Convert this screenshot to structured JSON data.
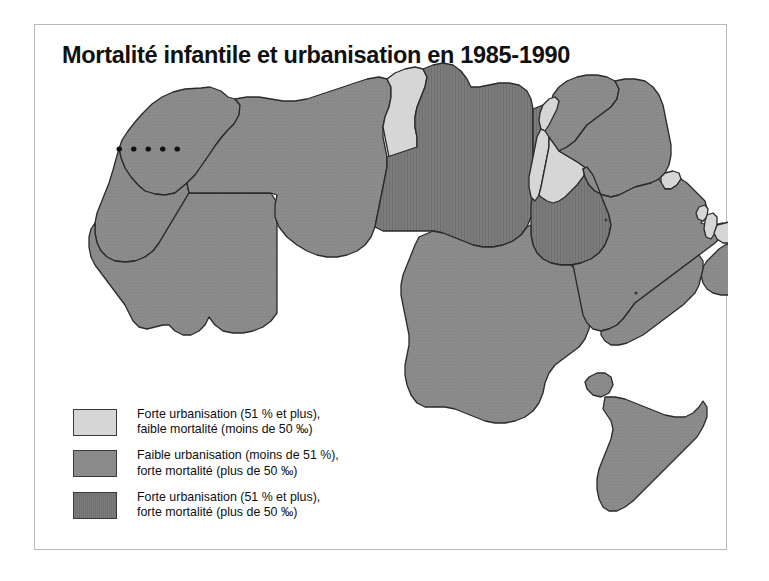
{
  "figure": {
    "title": "Mortalité infantile et urbanisation en 1985-1990",
    "background_color": "#ffffff",
    "frame_color": "#b9b9b9"
  },
  "map": {
    "region_name": "Afrique du Nord et Moyen-Orient",
    "ocean_color": "#ffffff",
    "border_color": "#2a2a2a",
    "disputed_border_style": "dotted",
    "classes": {
      "light": "#d6d6d6",
      "medium": "#8b8b8b",
      "dark": "#7c7c7c"
    },
    "countries": [
      {
        "name": "Maroc",
        "class": "medium"
      },
      {
        "name": "Sahara occidental",
        "class": "medium"
      },
      {
        "name": "Mauritanie",
        "class": "medium"
      },
      {
        "name": "Algérie",
        "class": "medium"
      },
      {
        "name": "Tunisie",
        "class": "light"
      },
      {
        "name": "Libye",
        "class": "dark"
      },
      {
        "name": "Égypte",
        "class": "dark"
      },
      {
        "name": "Soudan",
        "class": "medium"
      },
      {
        "name": "Djibouti",
        "class": "medium"
      },
      {
        "name": "Somalie",
        "class": "medium"
      },
      {
        "name": "Syrie",
        "class": "medium"
      },
      {
        "name": "Liban",
        "class": "light"
      },
      {
        "name": "Israël",
        "class": "light"
      },
      {
        "name": "Jordanie",
        "class": "light"
      },
      {
        "name": "Irak",
        "class": "medium"
      },
      {
        "name": "Koweït",
        "class": "light"
      },
      {
        "name": "Arabie saoudite",
        "class": "medium"
      },
      {
        "name": "Bahreïn",
        "class": "light"
      },
      {
        "name": "Qatar",
        "class": "light"
      },
      {
        "name": "Émirats arabes unis",
        "class": "light"
      },
      {
        "name": "Oman",
        "class": "medium"
      },
      {
        "name": "Yémen",
        "class": "medium"
      }
    ]
  },
  "legend": {
    "items": [
      {
        "swatch_color": "#d6d6d6",
        "label": "Forte urbanisation (51 % et plus),\nfaible mortalité (moins de 50 ‰)"
      },
      {
        "swatch_color": "#8b8b8b",
        "label": "Faible urbanisation (moins de 51 %),\nforte mortalité (plus de 50 ‰)"
      },
      {
        "swatch_color": "#7c7c7c",
        "label": "Forte urbanisation (51 % et plus),\nforte mortalité (plus de 50 ‰)"
      }
    ]
  }
}
